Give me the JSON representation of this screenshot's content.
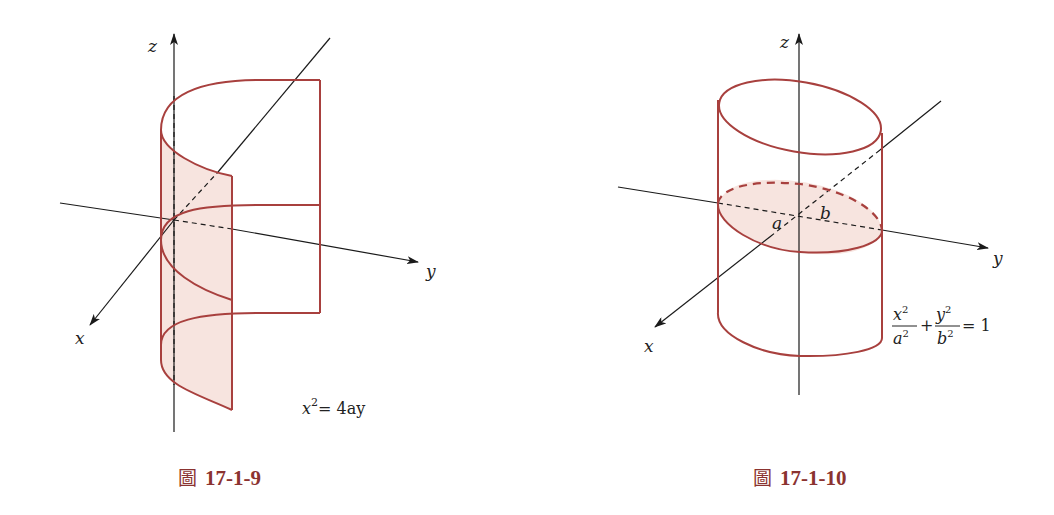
{
  "figures": [
    {
      "id": "17-1-9",
      "caption_prefix": "圖",
      "caption_number": "17-1-9",
      "axes": {
        "x": "x",
        "y": "y",
        "z": "z"
      },
      "surface": "parabolic cylinder",
      "equation": {
        "lhs_var": "x",
        "lhs_exp": "2",
        "rhs": "= 4ay"
      }
    },
    {
      "id": "17-1-10",
      "caption_prefix": "圖",
      "caption_number": "17-1-10",
      "axes": {
        "x": "x",
        "y": "y",
        "z": "z"
      },
      "surface": "elliptic cylinder",
      "semi_axes_labels": {
        "a": "a",
        "b": "b"
      },
      "equation": {
        "t1_num": "x",
        "t1_den": "a",
        "plus": "+",
        "t2_num": "y",
        "t2_den": "b",
        "exp": "2",
        "rhs": "= 1"
      }
    }
  ],
  "colors": {
    "surface_line": "#a8403e",
    "surface_fill": "#f7e4df",
    "axis": "#1a1a1a",
    "caption": "#8b3330"
  }
}
